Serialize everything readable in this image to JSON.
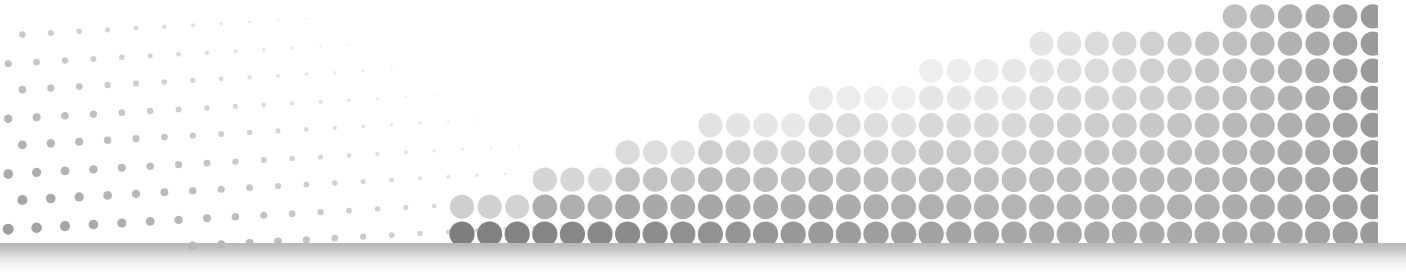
{
  "graphic": {
    "title": "Halftone dot gradient banner",
    "caption": "Abstract halftone illustration: a sparse field of small grey dots fading toward the upper right, overlaid by a rising wedge of large grey dots, above a soft grey baseline band.",
    "width": 1406,
    "height": 277,
    "background_color": "#ffffff"
  },
  "chart_data": {
    "type": "scatter",
    "subtitle": "",
    "xlabel": "",
    "ylabel": "",
    "xlim": [
      0,
      1406
    ],
    "ylim": [
      0,
      277
    ],
    "grid": false,
    "legend_position": "none",
    "annotations": [],
    "series": [
      {
        "name": "small-dot-field",
        "description": "Sparse background halftone: small dots on a 28px lattice, rows sloping upward to the right, dot radius shrinking and colour fading with distance to the upper-right.",
        "lattice": {
          "col_spacing": 28.4,
          "row_spacing": 27.6,
          "row_slope_px_per_col": -1.55,
          "odd_row_x_offset": 14.2,
          "origin_x": -6,
          "origin_y": 36,
          "columns": 52,
          "rows": 9
        },
        "radius": {
          "max": 6.4,
          "min": 1.0,
          "falloff_x": 620,
          "falloff_y": 300
        },
        "color": {
          "darkest": "#8c8c8c",
          "lightest": "#f4f4f4"
        },
        "clip": {
          "x0": 0,
          "x1": 1378,
          "y0": 0,
          "y1": 243
        }
      },
      {
        "name": "large-dot-wedge",
        "description": "Foreground halftone wedge: large dots on a 27.6px lattice stacked from the baseline, column height rising from left to right along a curved crest; dots lighten toward the crest and toward mid-right, darkening again at the far right edge.",
        "lattice": {
          "col_spacing": 27.6,
          "row_spacing": 27.2,
          "baseline_y": 243,
          "first_col_x": 462,
          "columns": 34
        },
        "radius": {
          "max": 12.6,
          "min": 11.2
        },
        "crest": {
          "description": "Top of the wedge as y-pixel per column, left to right",
          "start_x": 455,
          "start_y": 232,
          "end_x": 1378,
          "end_y": 30
        },
        "color": {
          "darkest": "#7f7f7f",
          "mid": "#b4b4b4",
          "lightest": "#eeeeee",
          "right_edge": "#9a9a9a"
        },
        "clip": {
          "x0": 0,
          "x1": 1378,
          "y0": 0,
          "y1": 243
        }
      }
    ],
    "baseline_band": {
      "name": "baseline-shadow-band",
      "y_top": 243,
      "y_bottom": 277,
      "colors": {
        "top": "#b9b9b9",
        "bottom": "#ffffff"
      }
    },
    "right_margin": {
      "x_start": 1378,
      "x_end": 1406,
      "color": "#ffffff"
    }
  }
}
